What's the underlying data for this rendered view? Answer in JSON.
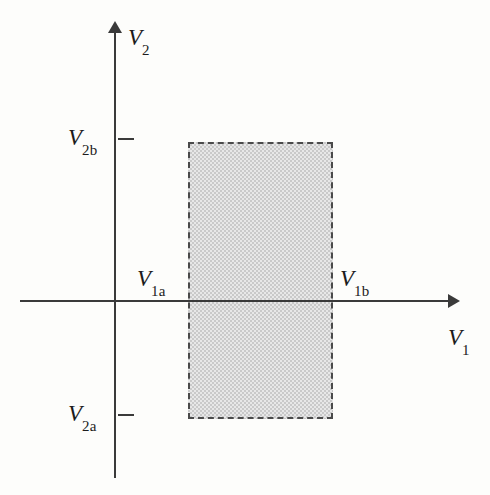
{
  "figure": {
    "background_color": "#fdfdfb",
    "axis_color": "#3a3a3a",
    "region_fill_color": "#c9c9c9",
    "region_border_color": "#4a4a4a",
    "width": 490,
    "height": 495
  },
  "axes": {
    "x": {
      "label": "V",
      "sublabel": "1",
      "arrow": "right-arrow-icon"
    },
    "y": {
      "label": "V",
      "sublabel": "2",
      "arrow": "up-arrow-icon"
    }
  },
  "ticks": {
    "v2b": {
      "label": "V",
      "sublabel": "2b"
    },
    "v2a": {
      "label": "V",
      "sublabel": "2a"
    }
  },
  "annotations": {
    "v1a": {
      "label": "V",
      "sublabel": "1a"
    },
    "v1b": {
      "label": "V",
      "sublabel": "1b"
    }
  },
  "chart_data": {
    "type": "area",
    "title": "",
    "xlabel": "V1",
    "ylabel": "V2",
    "grid": false,
    "legend": null,
    "xlim": [
      -0.66,
      2.33
    ],
    "ylim": [
      -1.71,
      1.71
    ],
    "x_tick_labels": [],
    "y_tick_labels": [
      "V2b",
      "V2a"
    ],
    "annotations": [
      "V1a",
      "V1b",
      "V2a",
      "V2b"
    ],
    "shapes": [
      {
        "kind": "rectangle",
        "name": "feasible-region",
        "x_from_label": "V1a",
        "x_to_label": "V1b",
        "y_from_label": "V2a",
        "y_to_label": "V2b",
        "x_from": 0.5,
        "x_to": 1.28,
        "y_from": -0.71,
        "y_to": 1.0,
        "fill": "#c9c9c9",
        "fill_pattern": "checkered",
        "border_style": "dashed",
        "border_color": "#4a4a4a"
      }
    ]
  }
}
